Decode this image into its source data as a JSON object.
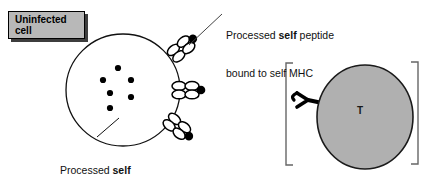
{
  "figure": {
    "width": 430,
    "height": 175,
    "background": "#ffffff",
    "type": "immunology-diagram",
    "topic": "Uninfected cell presenting processed self peptide on self MHC to a T cell"
  },
  "callout_box": {
    "label": "Uninfected\ncell",
    "fill_color": "#b8b8b8",
    "border_color": "#000000",
    "shadow_color": "#3d3d3d"
  },
  "annotations": [
    {
      "id": "mhc-annotation",
      "line1_pre": "Processed ",
      "line1_bold": "self",
      "line1_post": " peptide",
      "line2": "bound to self MHC",
      "leader_from": "top-mhc-molecule",
      "color": "#111111"
    },
    {
      "id": "peptide-annotation",
      "line1_pre": "Processed ",
      "line1_bold": "self",
      "line1_post": "",
      "line2": "peptides",
      "leader_from": "cell-interior-peptides",
      "color": "#111111"
    }
  ],
  "uninfected_cell": {
    "name": "uninfected-cell",
    "fill_color": "#ffffff",
    "outline_color": "#111111",
    "center_x": 123,
    "center_y": 90,
    "radius_x": 57,
    "radius_y": 56,
    "interior_peptide_count": 6,
    "interior_peptide_color": "#000000",
    "mhc_molecule_count": 3,
    "mhc_label": "self-MHC-with-peptide"
  },
  "t_cell": {
    "name": "t-cell",
    "letter": "T",
    "fill_color": "#b0b0b0",
    "outline_color": "#1a1a1a",
    "center_x": 365,
    "center_y": 117,
    "radius_x": 48,
    "radius_y": 52,
    "receptor_label": "t-cell-receptor",
    "receptor_color": "#000000",
    "bracket_color": "#555555",
    "bracket_left_x": 285,
    "bracket_right_x": 418,
    "bracket_top_y": 62,
    "bracket_bottom_y": 166
  }
}
